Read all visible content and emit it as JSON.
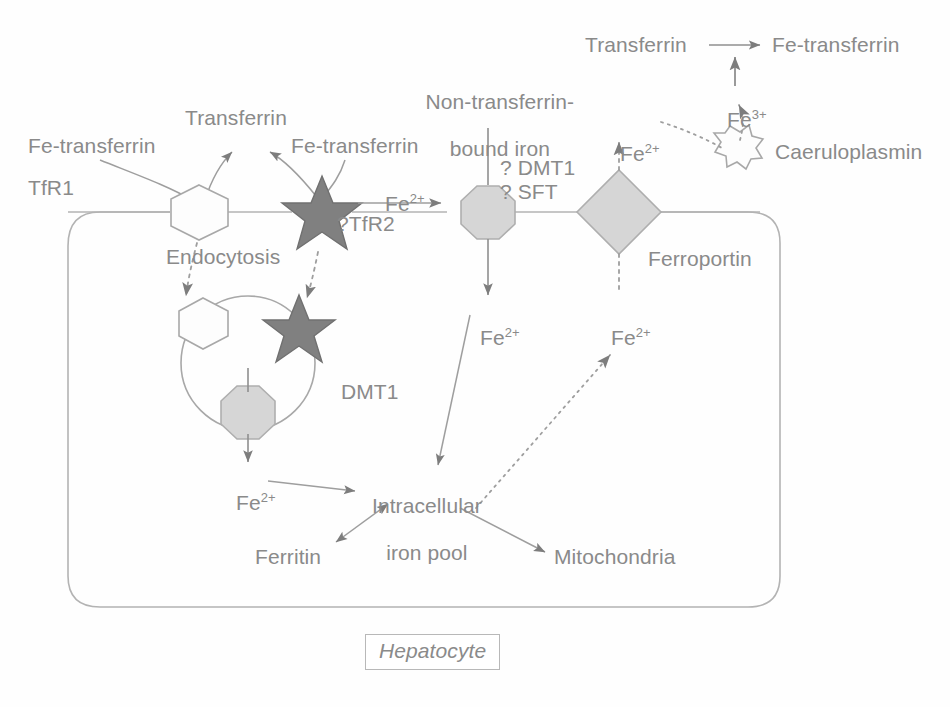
{
  "figure": {
    "title_box": {
      "label": "Hepatocyte"
    },
    "colors": {
      "text": "#8a8a8a",
      "stroke": "#b0b0b0",
      "star_fill": "#808080",
      "star_stroke": "#6f6f6f",
      "shape_fill": "#d6d6d6",
      "shape_stroke": "#b0b0b0",
      "hexagon_fill": "#fdfdfd",
      "background": "#fefefe"
    }
  },
  "labels": {
    "fe_transferrin_left": "Fe-transferrin",
    "transferrin_top": "Transferrin",
    "fe_transferrin_mid": "Fe-transferrin",
    "tfr1": "TfR1",
    "tfr2_query": "?TfR2",
    "endocytosis": "Endocytosis",
    "non_transferrin_bound_iron_line1": "Non-transferrin-",
    "non_transferrin_bound_iron_line2": "bound iron",
    "dmt1_query": "? DMT1",
    "sft_query": "? SFT",
    "dmt1_cytosol": "DMT1",
    "ferroportin": "Ferroportin",
    "caeruloplasmin": "Caeruloplasmin",
    "transferrin_right": "Transferrin",
    "fe_transferrin_right": "Fe-transferrin",
    "intracellular_iron_pool_line1": "Intracellular",
    "intracellular_iron_pool_line2": "iron pool",
    "ferritin": "Ferritin",
    "mitochondria": "Mitochondria"
  },
  "ion_labels": {
    "fe2_influx": {
      "element": "Fe",
      "charge": "2+"
    },
    "fe2_vesicle_out": {
      "element": "Fe",
      "charge": "2+"
    },
    "fe2_dmt1_out": {
      "element": "Fe",
      "charge": "2+"
    },
    "fe2_ferroportin_in": {
      "element": "Fe",
      "charge": "2+"
    },
    "fe2_ferroportin_out": {
      "element": "Fe",
      "charge": "2+"
    },
    "fe3_oxidised": {
      "element": "Fe",
      "charge": "3+"
    }
  },
  "shapes": {
    "tfr1_receptor": "hexagon",
    "tfr2_receptor": "star",
    "vesicle_hexagon": "hexagon",
    "vesicle_star": "star",
    "vesicle_dmt1": "octagon",
    "membrane_dmt1": "octagon",
    "ferroportin": "diamond",
    "caeruloplasmin": "starburst"
  }
}
